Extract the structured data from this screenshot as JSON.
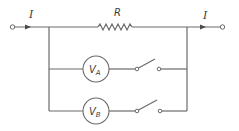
{
  "diagram": {
    "type": "circuit",
    "labels": {
      "current_in": "I",
      "current_out": "I",
      "resistor": "R",
      "voltmeter_a_main": "V",
      "voltmeter_a_sub": "A",
      "voltmeter_b_main": "V",
      "voltmeter_b_sub": "B"
    },
    "components": [
      {
        "id": "terminal-left",
        "kind": "terminal"
      },
      {
        "id": "resistor-R",
        "kind": "resistor",
        "label": "R"
      },
      {
        "id": "voltmeter-A",
        "kind": "voltmeter",
        "label": "VA"
      },
      {
        "id": "switch-A",
        "kind": "switch",
        "state": "open"
      },
      {
        "id": "voltmeter-B",
        "kind": "voltmeter",
        "label": "VB"
      },
      {
        "id": "switch-B",
        "kind": "switch",
        "state": "open"
      },
      {
        "id": "terminal-right",
        "kind": "terminal"
      }
    ],
    "colors": {
      "wire": "#6a6a6a",
      "text": "#3a3a3a",
      "background": "#ffffff"
    }
  }
}
